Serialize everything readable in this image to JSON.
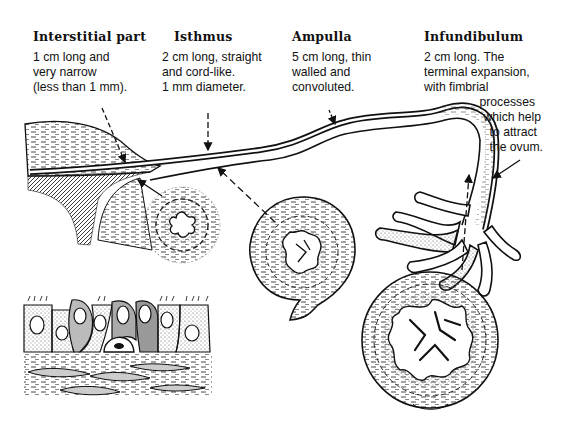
{
  "diagram": {
    "sections": [
      {
        "title": "Interstitial part",
        "lines": [
          "1 cm long and",
          "very narrow",
          "(less than 1 mm)."
        ]
      },
      {
        "title": "Isthmus",
        "lines": [
          "2 cm long, straight",
          "and cord-like.",
          "1 mm diameter."
        ]
      },
      {
        "title": "Ampulla",
        "lines": [
          "5 cm long, thin",
          "walled and",
          "convoluted."
        ]
      },
      {
        "title": "Infundibulum",
        "lines": [
          "2 cm long. The",
          "terminal expansion,",
          "with fimbrial"
        ],
        "continued_lines": [
          "processes",
          "which help",
          "to attract",
          "the ovum."
        ]
      }
    ],
    "illustrations": [
      {
        "name": "uterine-wall",
        "description": "uterine wall with tube entering"
      },
      {
        "name": "tube-body",
        "description": "tube running from uterus to fimbriae"
      },
      {
        "name": "isthmus-cross-section",
        "description": "small star-shaped lumen"
      },
      {
        "name": "ampulla-cross-section",
        "description": "branched mucosal folds"
      },
      {
        "name": "infundibulum-cross-section",
        "description": "highly folded mucosa"
      },
      {
        "name": "fimbriae",
        "description": "finger-like processes"
      },
      {
        "name": "epithelium-detail",
        "description": "ciliated and secretory cells over connective tissue"
      }
    ],
    "colors": {
      "ink": "#111111",
      "background": "#ffffff",
      "stipple": "#555555"
    }
  }
}
